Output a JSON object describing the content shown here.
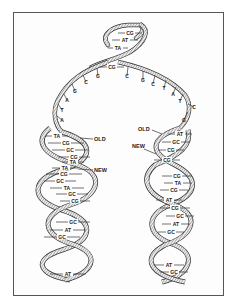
{
  "diagram": {
    "parent_helix": {
      "base_pairs": [
        "CG",
        "AT",
        "TA",
        "CG"
      ]
    },
    "replication_fork": {
      "left_strand_bases": [
        "G",
        "C",
        "G",
        "A",
        "T",
        "A"
      ],
      "right_strand_bases": [
        "C",
        "G",
        "C",
        "T",
        "A",
        "T",
        "C",
        "G"
      ]
    },
    "left_daughter_helix": {
      "old_label": "OLD",
      "new_label": "NEW",
      "base_pairs": [
        "TA",
        "CG",
        "GC",
        "CG",
        "TA",
        "TA",
        "CG",
        "GC",
        "TA",
        "GC",
        "CG",
        "GC",
        "AT",
        "GC",
        "AT"
      ]
    },
    "right_daughter_helix": {
      "old_label": "OLD",
      "new_label": "NEW",
      "base_pairs": [
        "AT",
        "GC",
        "CG",
        "CG",
        "CG",
        "TA",
        "CG",
        "AT",
        "CG",
        "GC",
        "AT",
        "GC",
        "AT",
        "GC"
      ]
    },
    "colors": {
      "strand_fill": "#e8e8e8",
      "strand_stroke": "#333333",
      "hatch": "#555555",
      "frame": "#555555"
    }
  }
}
